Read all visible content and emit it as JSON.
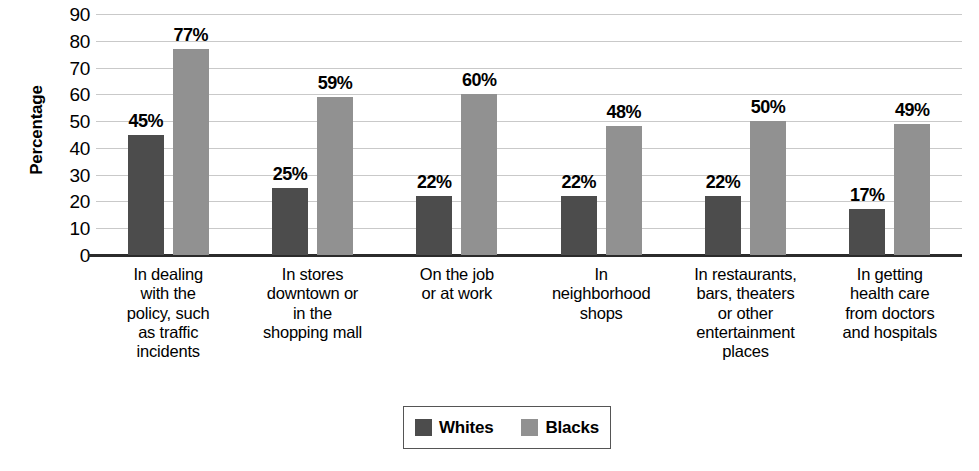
{
  "chart_data": {
    "type": "bar",
    "title": "",
    "xlabel": "",
    "ylabel": "Percentage",
    "ylim": [
      0,
      90
    ],
    "ytick_step": 10,
    "yticks": [
      90,
      80,
      70,
      60,
      50,
      40,
      30,
      20,
      10,
      0
    ],
    "grid": true,
    "legend_position": "bottom-center",
    "value_suffix": "%",
    "categories": [
      "In dealing with the policy, such as traffic incidents",
      "In stores downtown or in the shopping mall",
      "On the job or at work",
      "In neighborhood shops",
      "In restaurants, bars, theaters or other entertainment places",
      "In getting health care from doctors and hospitals"
    ],
    "category_lines": [
      [
        "In dealing",
        "with the",
        "policy, such",
        "as traffic",
        "incidents"
      ],
      [
        "In stores",
        "downtown or",
        "in the",
        "shopping mall"
      ],
      [
        "On the job",
        "or at work"
      ],
      [
        "In",
        "neighborhood",
        "shops"
      ],
      [
        "In restaurants,",
        "bars, theaters",
        "or other",
        "entertainment",
        "places"
      ],
      [
        "In getting",
        "health care",
        "from doctors",
        "and hospitals"
      ]
    ],
    "series": [
      {
        "name": "Whites",
        "color": "#4c4c4c",
        "values": [
          45,
          25,
          22,
          22,
          22,
          17
        ],
        "labels": [
          "45%",
          "25%",
          "22%",
          "22%",
          "22%",
          "17%"
        ]
      },
      {
        "name": "Blacks",
        "color": "#919191",
        "values": [
          77,
          59,
          60,
          48,
          50,
          49
        ],
        "labels": [
          "77%",
          "59%",
          "60%",
          "48%",
          "50%",
          "49%"
        ]
      }
    ]
  },
  "legend": {
    "items": [
      {
        "label": "Whites",
        "color": "#4c4c4c"
      },
      {
        "label": "Blacks",
        "color": "#919191"
      }
    ]
  },
  "colors": {
    "whites_bar": "#4c4c4c",
    "blacks_bar": "#919191",
    "gridline": "#c9c9c9",
    "axis": "#2b2b2b",
    "background": "#ffffff",
    "text": "#000000"
  }
}
